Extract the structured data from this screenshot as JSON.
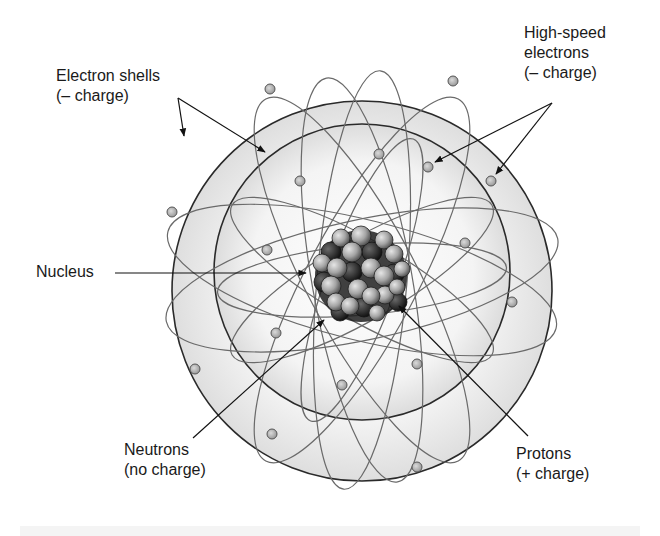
{
  "diagram": {
    "labels": {
      "electron_shells": {
        "line1": "Electron shells",
        "line2": "(– charge)"
      },
      "high_speed_electrons": {
        "line1": "High-speed",
        "line2": "electrons",
        "line3": "(– charge)"
      },
      "nucleus": {
        "line1": "Nucleus"
      },
      "neutrons": {
        "line1": "Neutrons",
        "line2": "(no charge)"
      },
      "protons": {
        "line1": "Protons",
        "line2": "(+ charge)"
      }
    },
    "colors": {
      "shell_stroke": "#2a2a2a",
      "orbit_stroke": "#6a6a6a",
      "electron_fill": "#b8b8b8",
      "proton_fill": "#a9a9a9",
      "neutron_fill": "#3a3a3a",
      "shell_fill": "#ececec"
    }
  }
}
